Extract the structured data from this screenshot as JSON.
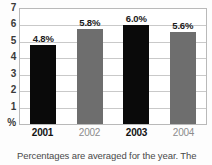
{
  "chart_data": {
    "type": "bar",
    "title": "",
    "subtitle": "",
    "xlabel": "",
    "ylabel": "%",
    "categories": [
      "2001",
      "2002",
      "2003",
      "2004"
    ],
    "values": [
      4.8,
      5.8,
      6.0,
      5.6
    ],
    "data_labels": [
      "4.8%",
      "5.8%",
      "6.0%",
      "5.6%"
    ],
    "bar_colors": [
      "#0a0a0a",
      "#6e6e6e",
      "#0a0a0a",
      "#6e6e6e"
    ],
    "category_emphasis": [
      "bold",
      "normal",
      "bold",
      "normal"
    ],
    "ylim": [
      0,
      7
    ],
    "yticks": [
      "7",
      "6",
      "5",
      "4",
      "3",
      "2",
      "1",
      "%"
    ],
    "ytick_values": [
      7,
      6,
      5,
      4,
      3,
      2,
      1,
      0
    ],
    "grid": true,
    "grid_axis": "y",
    "legend": false,
    "legend_position": "none",
    "annotation": "Percentages are averaged for the year. The",
    "colors": {
      "dark_bar": "#0a0a0a",
      "gray_bar": "#6e6e6e",
      "gridline": "#c9c9c9",
      "panel_border": "#b9b9b9",
      "axis_text": "#3a3a3a",
      "muted_text": "#8c8c8c",
      "caption_text": "#4a4a4a",
      "background": "#ffffff"
    }
  }
}
